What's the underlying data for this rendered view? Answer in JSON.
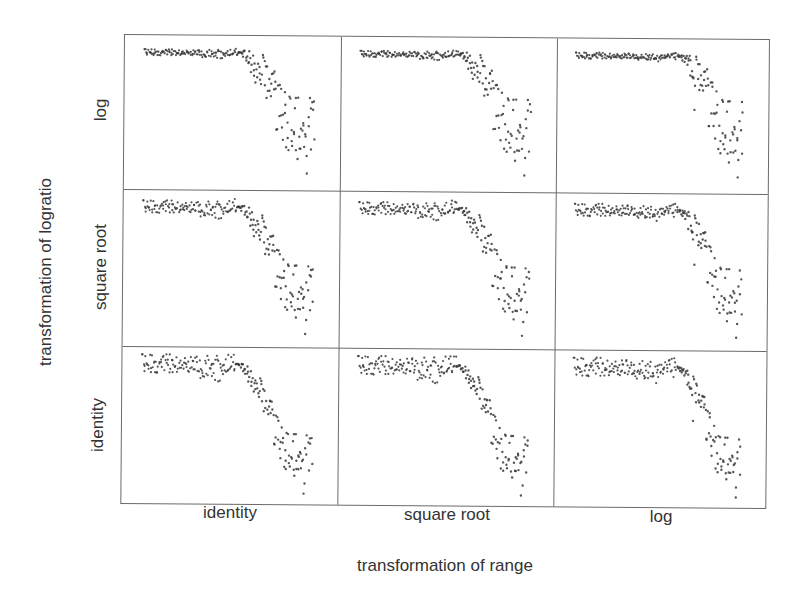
{
  "chart_data": {
    "type": "scatter",
    "layout": "3x3 scatterplot matrix of transformations",
    "title": "",
    "xlabel": "transformation of range",
    "ylabel": "transformation of logratio",
    "column_labels": [
      "identity",
      "square root",
      "log"
    ],
    "row_labels": [
      "log",
      "square root",
      "identity"
    ],
    "grid": false,
    "axes_ticks": "none",
    "point_color": "#3a3a3a",
    "panels": [
      {
        "row": "log",
        "col": "identity",
        "plateau_end_frac": 0.55,
        "drop_depth": 0.55,
        "spread": 0.42,
        "plateau_noise": 0.02
      },
      {
        "row": "log",
        "col": "square root",
        "plateau_end_frac": 0.58,
        "drop_depth": 0.55,
        "spread": 0.42,
        "plateau_noise": 0.02
      },
      {
        "row": "log",
        "col": "log",
        "plateau_end_frac": 0.62,
        "drop_depth": 0.55,
        "spread": 0.42,
        "plateau_noise": 0.02
      },
      {
        "row": "square root",
        "col": "identity",
        "plateau_end_frac": 0.55,
        "drop_depth": 0.62,
        "spread": 0.35,
        "plateau_noise": 0.04
      },
      {
        "row": "square root",
        "col": "square root",
        "plateau_end_frac": 0.58,
        "drop_depth": 0.62,
        "spread": 0.35,
        "plateau_noise": 0.04
      },
      {
        "row": "square root",
        "col": "log",
        "plateau_end_frac": 0.62,
        "drop_depth": 0.62,
        "spread": 0.35,
        "plateau_noise": 0.04
      },
      {
        "row": "identity",
        "col": "identity",
        "plateau_end_frac": 0.55,
        "drop_depth": 0.68,
        "spread": 0.28,
        "plateau_noise": 0.06
      },
      {
        "row": "identity",
        "col": "square root",
        "plateau_end_frac": 0.58,
        "drop_depth": 0.68,
        "spread": 0.28,
        "plateau_noise": 0.06
      },
      {
        "row": "identity",
        "col": "log",
        "plateau_end_frac": 0.62,
        "drop_depth": 0.68,
        "spread": 0.28,
        "plateau_noise": 0.06
      }
    ],
    "n_points_per_panel": 221
  },
  "labels": {
    "y_axis_title": "transformation of logratio",
    "x_axis_title": "transformation of range",
    "rows": [
      "log",
      "square root",
      "identity"
    ],
    "cols": [
      "identity",
      "square root",
      "log"
    ]
  }
}
